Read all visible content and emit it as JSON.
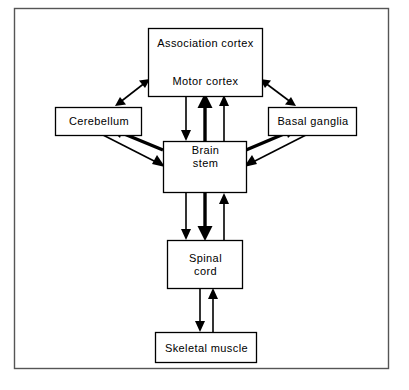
{
  "figure": {
    "background_color": "#ffffff",
    "line_color": "#000000",
    "frame_color": "#555555"
  },
  "nodes": [
    {
      "id": "association_cortex",
      "label": "Association cortex"
    },
    {
      "id": "motor_cortex",
      "label": "Motor cortex"
    },
    {
      "id": "cerebellum",
      "label": "Cerebellum"
    },
    {
      "id": "basal_ganglia",
      "label": "Basal ganglia"
    },
    {
      "id": "brain_stem",
      "label": "Brain\nstem"
    },
    {
      "id": "spinal_cord",
      "label": "Spinal\ncord"
    },
    {
      "id": "skeletal_muscle",
      "label": "Skeletal muscle"
    }
  ],
  "connections": [
    {
      "from": "association_cortex",
      "to": "motor_cortex",
      "style": "double-headed-arrow"
    },
    {
      "from": "motor_cortex",
      "to": "cerebellum",
      "style": "double-headed-arrow"
    },
    {
      "from": "motor_cortex",
      "to": "basal_ganglia",
      "style": "double-headed-arrow"
    },
    {
      "from": "motor_cortex",
      "to": "brain_stem",
      "style": "arrow-down"
    },
    {
      "from": "brain_stem",
      "to": "motor_cortex",
      "style": "arrow-up-thick"
    },
    {
      "from": "brain_stem",
      "to": "motor_cortex",
      "style": "arrow-up"
    },
    {
      "from": "brain_stem",
      "to": "cerebellum",
      "style": "arrow-up-left-thick"
    },
    {
      "from": "cerebellum",
      "to": "brain_stem",
      "style": "arrow-down-right"
    },
    {
      "from": "brain_stem",
      "to": "basal_ganglia",
      "style": "arrow-up-right-thick"
    },
    {
      "from": "basal_ganglia",
      "to": "brain_stem",
      "style": "arrow-down-left"
    },
    {
      "from": "brain_stem",
      "to": "spinal_cord",
      "style": "arrow-down"
    },
    {
      "from": "brain_stem",
      "to": "spinal_cord",
      "style": "arrow-down-thick"
    },
    {
      "from": "spinal_cord",
      "to": "brain_stem",
      "style": "arrow-up"
    },
    {
      "from": "spinal_cord",
      "to": "skeletal_muscle",
      "style": "arrow-down"
    },
    {
      "from": "skeletal_muscle",
      "to": "spinal_cord",
      "style": "arrow-up"
    },
    {
      "from": "brain_stem",
      "to": "brain_stem",
      "style": "dashed-internal-v"
    }
  ]
}
